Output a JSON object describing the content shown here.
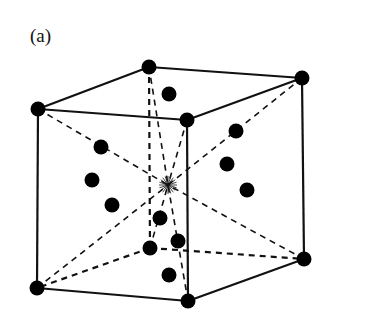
{
  "figure": {
    "panel_label": "(a)"
  },
  "colors": {
    "line": "#111111",
    "atom": "#000000",
    "background": "#ffffff"
  },
  "corners": [
    {
      "name": "back-top-left",
      "x": 149,
      "y": 67
    },
    {
      "name": "back-top-right",
      "x": 302,
      "y": 78
    },
    {
      "name": "front-top-left",
      "x": 38,
      "y": 109
    },
    {
      "name": "front-top-right",
      "x": 187,
      "y": 120
    },
    {
      "name": "front-bottom-left",
      "x": 37,
      "y": 288
    },
    {
      "name": "front-bottom-right",
      "x": 188,
      "y": 301
    },
    {
      "name": "back-bottom-right",
      "x": 304,
      "y": 259
    },
    {
      "name": "back-bottom-left",
      "x": 150,
      "y": 248
    }
  ],
  "center": {
    "x": 168,
    "y": 185
  },
  "interior_atoms": [
    {
      "x": 169,
      "y": 94
    },
    {
      "x": 236,
      "y": 131
    },
    {
      "x": 101,
      "y": 147
    },
    {
      "x": 227,
      "y": 164
    },
    {
      "x": 92,
      "y": 180
    },
    {
      "x": 247,
      "y": 190
    },
    {
      "x": 112,
      "y": 205
    },
    {
      "x": 160,
      "y": 218
    },
    {
      "x": 178,
      "y": 241
    },
    {
      "x": 169,
      "y": 275
    }
  ]
}
